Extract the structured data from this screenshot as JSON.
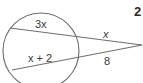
{
  "problem": {
    "number": "2"
  },
  "diagram": {
    "circle": {
      "cx": 41,
      "cy": 51,
      "r": 38
    },
    "external_point": {
      "x": 142,
      "y": 45
    },
    "secants": [
      {
        "name": "upper",
        "internal_segment_label": "3x",
        "external_segment_label": "x",
        "enter": {
          "x": 10,
          "y": 28
        },
        "exit": {
          "x": 78,
          "y": 37
        }
      },
      {
        "name": "lower",
        "internal_segment_label": "x + 2",
        "external_segment_label": "8",
        "enter": {
          "x": 12,
          "y": 70
        },
        "exit": {
          "x": 78,
          "y": 58
        }
      }
    ],
    "stroke_color": "#6e6e6e",
    "text_color": "#3a3a3a"
  }
}
